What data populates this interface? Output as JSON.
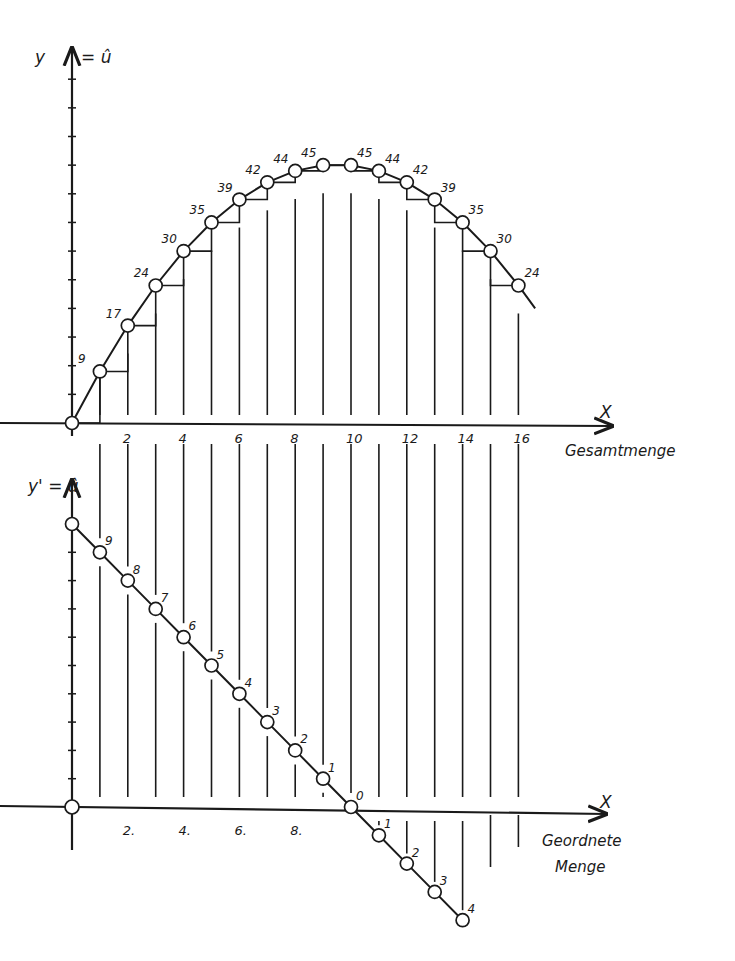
{
  "chart_data": [
    {
      "type": "line",
      "title": "",
      "ylabel": "y = û",
      "xlabel": "X",
      "x_caption": "Gesamtmenge",
      "x": [
        0,
        1,
        2,
        3,
        4,
        5,
        6,
        7,
        8,
        9,
        10,
        11,
        12,
        13,
        14,
        15,
        16
      ],
      "series": [
        {
          "name": "Gesamtnutzen",
          "values": [
            0,
            9,
            17,
            24,
            30,
            35,
            39,
            42,
            44,
            45,
            45,
            44,
            42,
            39,
            35,
            30,
            24
          ]
        }
      ],
      "point_labels": [
        "",
        "9",
        "17",
        "24",
        "30",
        "35",
        "39",
        "42",
        "44",
        "45",
        "45",
        "44",
        "42",
        "39",
        "35",
        "30",
        "24"
      ],
      "x_tick_labels": [
        "2",
        "4",
        "6",
        "8",
        "10",
        "12",
        "14",
        "16"
      ],
      "x_tick_values": [
        2,
        4,
        6,
        8,
        10,
        12,
        14,
        16
      ],
      "xlim": [
        0,
        19
      ],
      "ylim": [
        0,
        60
      ],
      "grid": "vertical lines at each integer x",
      "annotations": "staircase steps showing increments between successive points",
      "legend": "none"
    },
    {
      "type": "line",
      "title": "",
      "ylabel": "y' = û",
      "xlabel": "X",
      "x_caption": [
        "Geordnete",
        "Menge"
      ],
      "x": [
        0,
        1,
        2,
        3,
        4,
        5,
        6,
        7,
        8,
        9,
        10,
        11,
        12,
        13,
        14
      ],
      "series": [
        {
          "name": "Grenznutzen",
          "values": [
            10,
            9,
            8,
            7,
            6,
            5,
            4,
            3,
            2,
            1,
            0,
            -1,
            -2,
            -3,
            -4
          ]
        }
      ],
      "point_labels": [
        "",
        "9",
        "8",
        "7",
        "6",
        "5",
        "4",
        "3",
        "2",
        "1",
        "0",
        "1",
        "2",
        "3",
        "4"
      ],
      "x_tick_labels": [
        "2.",
        "4.",
        "6.",
        "8."
      ],
      "x_tick_values": [
        2,
        4,
        6,
        8
      ],
      "xlim": [
        0,
        19
      ],
      "ylim": [
        -4,
        11
      ],
      "grid": "vertical lines at each integer x",
      "legend": "none"
    }
  ],
  "labels": {
    "upper_y_axis": "y",
    "upper_y_axis_eq": "= û",
    "upper_x_axis": "X",
    "upper_x_caption": "Gesamtmenge",
    "lower_y_axis": "y' = û",
    "lower_x_axis": "X",
    "lower_x_caption_1": "Geordnete",
    "lower_x_caption_2": "Menge"
  },
  "colors": {
    "ink": "#1a1a1a",
    "paper": "#ffffff"
  }
}
